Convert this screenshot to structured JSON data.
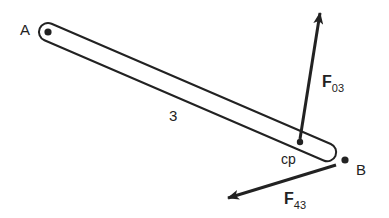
{
  "diagram": {
    "link": {
      "label": "3",
      "stroke": "#222222"
    },
    "points": {
      "A": {
        "label": "A"
      },
      "B": {
        "label": "B"
      },
      "cp": {
        "label": "cp"
      }
    },
    "forces": {
      "F03": {
        "symbol": "F",
        "subscript": "03"
      },
      "F43": {
        "symbol": "F",
        "subscript": "43"
      }
    },
    "colors": {
      "ink": "#222222",
      "background": "#ffffff"
    }
  }
}
